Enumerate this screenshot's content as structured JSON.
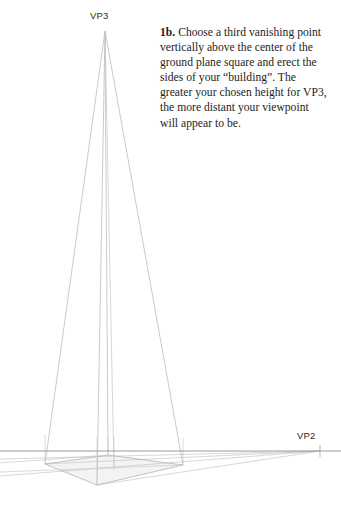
{
  "page": {
    "background_color": "#ffffff",
    "width": 341,
    "height": 508
  },
  "caption": {
    "lead_label": "1b.",
    "body_text": " Choose a third vanishing point vertically above the center of the ground plane square and erect the sides of your “building”. The greater your chosen height for VP3, the more distant your viewpoint will appear to be.",
    "text_color": "#1d1d1d"
  },
  "labels": {
    "vp3": "VP3",
    "vp2": "VP2",
    "label_color": "#2b2b2b"
  },
  "diagram": {
    "line_color": "#b9b9b9",
    "horizon_color": "#8e8e8e",
    "fill_color": "#f2f3f4",
    "vanishing_point_3": {
      "x": 105,
      "y": 31
    },
    "vanishing_point_2": {
      "x": 320,
      "y": 451
    },
    "horizon_y": 451
  }
}
